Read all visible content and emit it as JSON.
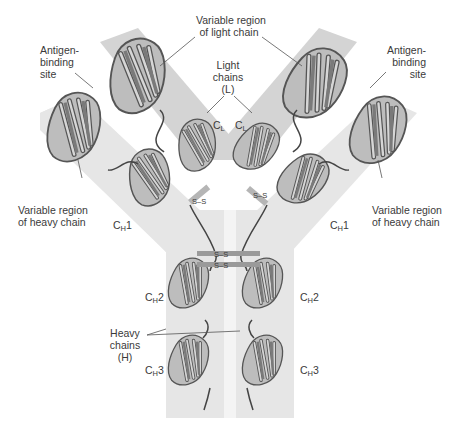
{
  "colors": {
    "band_light": "#e6e6e6",
    "band_dark": "#d2d2d2",
    "ribbon_dark": "#5c5c5c",
    "ribbon_light": "#c8c8c8",
    "strand_mid": "#8f8f8f",
    "label": "#3a3a3a",
    "leader_line": "#555555"
  },
  "labels": {
    "variable_light": {
      "line1": "Variable region",
      "line2": "of light chain"
    },
    "antigen_left": {
      "line1": "Antigen-",
      "line2": "binding",
      "line3": "site"
    },
    "antigen_right": {
      "line1": "Antigen-",
      "line2": "binding",
      "line3": "site"
    },
    "light_chains": {
      "line1": "Light",
      "line2": "chains",
      "line3": "(L)"
    },
    "cl_left": {
      "main": "C",
      "sub": "L"
    },
    "cl_right": {
      "main": "C",
      "sub": "L"
    },
    "variable_heavy_left": {
      "line1": "Variable region",
      "line2": "of heavy chain"
    },
    "variable_heavy_right": {
      "line1": "Variable region",
      "line2": "of heavy chain"
    },
    "ch1_left": {
      "main": "C",
      "sub": "H",
      "suffix": "1"
    },
    "ch1_right": {
      "main": "C",
      "sub": "H",
      "suffix": "1"
    },
    "ch2_left": {
      "main": "C",
      "sub": "H",
      "suffix": "2"
    },
    "ch2_right": {
      "main": "C",
      "sub": "H",
      "suffix": "2"
    },
    "ch3_left": {
      "main": "C",
      "sub": "H",
      "suffix": "3"
    },
    "ch3_right": {
      "main": "C",
      "sub": "H",
      "suffix": "3"
    },
    "heavy_chains": {
      "line1": "Heavy",
      "line2": "chains",
      "line3": "(H)"
    }
  },
  "disulfide_bonds": {
    "hinge_1": "S–S",
    "hinge_2": "S–S",
    "light_heavy_left": "S–S",
    "light_heavy_right": "S–S"
  }
}
